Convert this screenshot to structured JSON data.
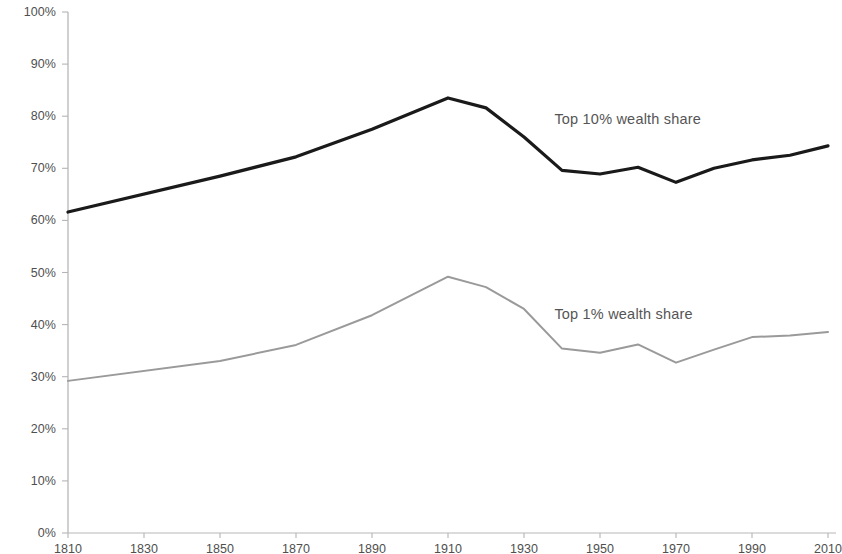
{
  "chart_data": {
    "type": "line",
    "title": "",
    "subtitle": "",
    "xlabel": "",
    "ylabel": "",
    "xlim": [
      1810,
      2010
    ],
    "ylim": [
      0,
      100
    ],
    "grid": false,
    "legend_position": "inline-right",
    "x_ticks": [
      1810,
      1830,
      1850,
      1870,
      1890,
      1910,
      1930,
      1950,
      1970,
      1990,
      2010
    ],
    "x_tick_labels": [
      "1810",
      "1830",
      "1850",
      "1870",
      "1890",
      "1910",
      "1930",
      "1950",
      "1970",
      "1990",
      "2010"
    ],
    "y_ticks": [
      0,
      10,
      20,
      30,
      40,
      50,
      60,
      70,
      80,
      90,
      100
    ],
    "y_tick_labels": [
      "0%",
      "10%",
      "20%",
      "30%",
      "40%",
      "50%",
      "60%",
      "70%",
      "80%",
      "90%",
      "100%"
    ],
    "x": [
      1810,
      1850,
      1870,
      1890,
      1910,
      1920,
      1930,
      1940,
      1950,
      1960,
      1970,
      1980,
      1990,
      2000,
      2010
    ],
    "series": [
      {
        "name": "Top 10% wealth share",
        "color": "#1a1a1a",
        "line_width": 3.2,
        "values": [
          61.6,
          68.5,
          72.2,
          77.5,
          83.5,
          81.6,
          76.0,
          69.6,
          68.9,
          70.2,
          67.3,
          70.0,
          71.6,
          72.5,
          74.3
        ],
        "label": "Top 10% wealth share",
        "label_x": 1938,
        "label_y": 81.0
      },
      {
        "name": "Top 1% wealth share",
        "color": "#9a9a9a",
        "line_width": 2.0,
        "values": [
          29.2,
          33.0,
          36.1,
          41.8,
          49.2,
          47.2,
          43.0,
          35.4,
          34.6,
          36.2,
          32.7,
          35.2,
          37.6,
          37.9,
          38.6
        ],
        "label": "Top 1% wealth share",
        "label_x": 1938,
        "label_y": 43.5
      }
    ]
  },
  "axes": {
    "axis_color": "#aaaaaa",
    "tick_color": "#b5b5b5",
    "baseline_color": "#b8b8b8"
  }
}
